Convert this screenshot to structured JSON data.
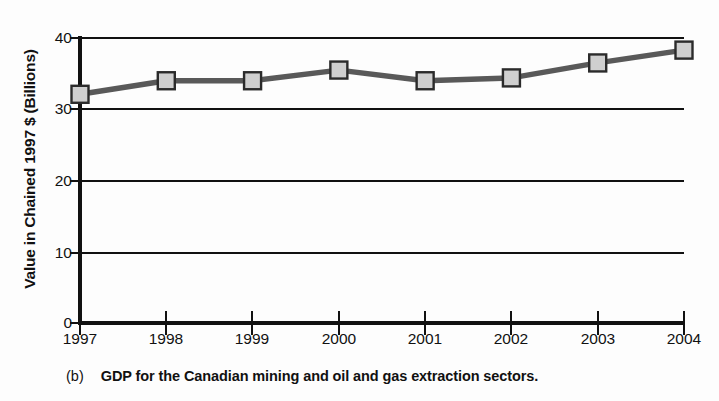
{
  "chart_data": {
    "type": "line",
    "title": "",
    "caption_index": "(b)",
    "caption_text": "GDP for the Canadian mining and oil and gas extraction sectors.",
    "xlabel": "",
    "ylabel": "Value in Chained 1997 $ (Billions)",
    "categories": [
      "1997",
      "1998",
      "1999",
      "2000",
      "2001",
      "2002",
      "2003",
      "2004"
    ],
    "values": [
      32.1,
      34.0,
      34.0,
      35.5,
      34.0,
      34.4,
      36.5,
      38.3
    ],
    "series": [
      {
        "name": "GDP",
        "values": [
          32.1,
          34.0,
          34.0,
          35.5,
          34.0,
          34.4,
          36.5,
          38.3
        ]
      }
    ],
    "ylim": [
      0,
      40
    ],
    "yticks": [
      0,
      10,
      20,
      30,
      40
    ],
    "ytick_labels": [
      "0",
      "10",
      "20",
      "30",
      "40"
    ],
    "xlim": [
      "1997",
      "2004"
    ],
    "grid": "horizontal",
    "legend": "none",
    "marker": "square",
    "colors": {
      "line": "#595959",
      "marker_fill": "#cfcfcf",
      "marker_edge": "#2b2b2b",
      "axis": "#111111",
      "grid": "#111111",
      "background": "#fdfdfd"
    }
  }
}
